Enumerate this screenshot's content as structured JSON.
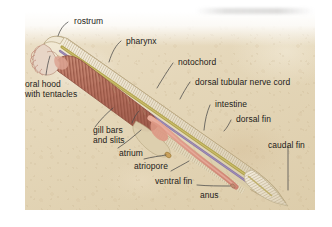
{
  "figure": {
    "view": "lateral cutaway diagram",
    "background_color": "#e4d6b8",
    "panel_border_color": "#ffffff",
    "label_color": "#1d1b19",
    "leader_line_color": "#4a4a4a"
  },
  "labels": [
    {
      "id": "rostrum",
      "text": "rostrum"
    },
    {
      "id": "pharynx",
      "text": "pharynx"
    },
    {
      "id": "notochord",
      "text": "notochord"
    },
    {
      "id": "dorsal-tubular-nerve-cord",
      "text": "dorsal tubular nerve cord"
    },
    {
      "id": "intestine",
      "text": "intestine"
    },
    {
      "id": "dorsal-fin",
      "text": "dorsal fin"
    },
    {
      "id": "caudal-fin",
      "text": "caudal fin"
    },
    {
      "id": "oral-hood-line1",
      "text": "oral hood"
    },
    {
      "id": "oral-hood-line2",
      "text": "with tentacles"
    },
    {
      "id": "gill-bars-line1",
      "text": "gill bars"
    },
    {
      "id": "gill-bars-line2",
      "text": "and slits"
    },
    {
      "id": "atrium",
      "text": "atrium"
    },
    {
      "id": "atriopore",
      "text": "atriopore"
    },
    {
      "id": "ventral-fin",
      "text": "ventral fin"
    },
    {
      "id": "anus",
      "text": "anus"
    }
  ],
  "anatomy_colors": {
    "body_wall": "#e6dcc0",
    "pharynx_gill_basket": "#b5705e",
    "gill_bar_stripe": "#8d4c3c",
    "notochord": "#b0a24a",
    "nerve_cord": "#8c7aa6",
    "intestine": "#d9917e",
    "atrium_cavity": "#ddcfae",
    "caudal_fin": "#efe6d2",
    "oral_hood": "#dcb5a6",
    "tentacles": "#c08a7a"
  }
}
